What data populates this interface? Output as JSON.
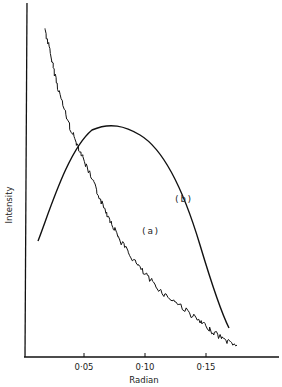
{
  "chart_data": {
    "type": "line",
    "title": "",
    "xlabel": "Radian",
    "ylabel": "Intensity",
    "xlim": [
      0.0,
      0.21
    ],
    "ylim": [
      0,
      1
    ],
    "grid": false,
    "legend": "inline labels",
    "x_ticks": [
      0.05,
      0.1,
      0.15
    ],
    "x_tick_labels": [
      "0·05",
      "0·10",
      "0·15"
    ],
    "y_ticks": [],
    "series": [
      {
        "name": "(a)",
        "label": "(a)",
        "style": "noisy line",
        "x": [
          0.018,
          0.025,
          0.035,
          0.045,
          0.055,
          0.065,
          0.075,
          0.085,
          0.095,
          0.105,
          0.115,
          0.125,
          0.135,
          0.145,
          0.155,
          0.165,
          0.175
        ],
        "y": [
          0.93,
          0.86,
          0.78,
          0.7,
          0.62,
          0.55,
          0.49,
          0.43,
          0.38,
          0.33,
          0.28,
          0.23,
          0.19,
          0.14,
          0.1,
          0.06,
          0.04
        ]
      },
      {
        "name": "(b)",
        "label": "(b)",
        "style": "smooth line",
        "x": [
          0.012,
          0.02,
          0.03,
          0.04,
          0.05,
          0.06,
          0.07,
          0.08,
          0.09,
          0.1,
          0.11,
          0.12,
          0.13,
          0.14,
          0.15,
          0.16,
          0.17
        ],
        "y": [
          0.33,
          0.41,
          0.5,
          0.57,
          0.62,
          0.64,
          0.65,
          0.645,
          0.625,
          0.59,
          0.54,
          0.47,
          0.39,
          0.3,
          0.21,
          0.12,
          0.06
        ]
      }
    ],
    "annotations": [
      {
        "text": "(a)",
        "x": 0.095,
        "y": 0.36
      },
      {
        "text": "(b)",
        "x": 0.128,
        "y": 0.5
      }
    ]
  },
  "labels": {
    "ylabel": "Intensity",
    "xlabel": "Radian",
    "tick_005": "0·05",
    "tick_010": "0·10",
    "tick_015": "0·15",
    "curve_a": "(a)",
    "curve_b": "(b)"
  }
}
